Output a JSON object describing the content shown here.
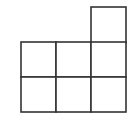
{
  "diagram": {
    "type": "grid-polyomino",
    "stroke_color": "#333333",
    "fill_color": "#ffffff",
    "cell_size": 35,
    "origin": {
      "x": 21,
      "y": 7
    },
    "cells": [
      {
        "row": 0,
        "col": 2
      },
      {
        "row": 1,
        "col": 0
      },
      {
        "row": 1,
        "col": 1
      },
      {
        "row": 1,
        "col": 2
      },
      {
        "row": 2,
        "col": 0
      },
      {
        "row": 2,
        "col": 1
      },
      {
        "row": 2,
        "col": 2
      }
    ]
  }
}
